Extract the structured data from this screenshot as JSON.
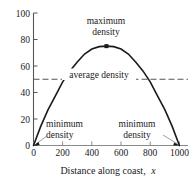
{
  "chart_data": {
    "type": "line",
    "title": "",
    "xlabel": "Distance along coast, x",
    "ylabel": "",
    "xlim": [
      0,
      1000
    ],
    "ylim": [
      0,
      100
    ],
    "grid": false,
    "legend": "none",
    "x_ticks": [
      "0",
      "200",
      "400",
      "600",
      "800",
      "1000"
    ],
    "x_tick_values": [
      0,
      200,
      400,
      600,
      800,
      1000
    ],
    "y_ticks": [
      "0",
      "20",
      "40",
      "60",
      "80",
      "100"
    ],
    "y_tick_values": [
      0,
      20,
      40,
      60,
      80,
      100
    ],
    "series": [
      {
        "name": "density",
        "style": "solid-curve",
        "color": "#1a1a1a",
        "x": [
          0,
          50,
          100,
          150,
          200,
          250,
          300,
          350,
          400,
          450,
          500,
          550,
          600,
          650,
          700,
          750,
          800,
          850,
          900,
          950,
          1000
        ],
        "values": [
          0,
          14.6,
          27.0,
          37.5,
          48.0,
          56.3,
          63.0,
          69.0,
          72.8,
          74.6,
          75.0,
          74.6,
          72.8,
          69.0,
          63.0,
          56.3,
          48.0,
          37.5,
          27.0,
          14.6,
          0
        ]
      },
      {
        "name": "average density",
        "style": "dashed-horizontal",
        "color": "#555555",
        "value": 50
      }
    ],
    "markers": [
      {
        "name": "maximum",
        "x": 500,
        "y": 75
      }
    ],
    "annotations": [
      {
        "name": "maximum-density",
        "line1": "maximum",
        "line2": "density",
        "target_x": 500,
        "target_y": 75
      },
      {
        "name": "average-density",
        "line1": "average density",
        "line2": "",
        "target_x": 400,
        "target_y": 50
      },
      {
        "name": "minimum-density-left",
        "line1": "minimum",
        "line2": "density",
        "target_x": 0,
        "target_y": 0
      },
      {
        "name": "minimum-density-right",
        "line1": "minimum",
        "line2": "density",
        "target_x": 1000,
        "target_y": 0
      }
    ],
    "colors": {
      "curve": "#1a1a1a",
      "axis": "#555555",
      "dashed": "#666666",
      "leader": "#9a9a9a",
      "text": "#1a1a1a",
      "background": "#ffffff"
    }
  },
  "axis_title": {
    "prefix": "Distance along coast,",
    "variable": "x"
  },
  "labels": {
    "maximum_line1": "maximum",
    "maximum_line2": "density",
    "average": "average density",
    "minimum_left_line1": "minimum",
    "minimum_left_line2": "density",
    "minimum_right_line1": "minimum",
    "minimum_right_line2": "density"
  },
  "ticks": {
    "y": {
      "t100": "100",
      "t80": "80",
      "t60": "60",
      "t40": "40",
      "t20": "20",
      "t0": "0"
    },
    "x": {
      "t0": "0",
      "t200": "200",
      "t400": "400",
      "t600": "600",
      "t800": "800",
      "t1000": "1000"
    }
  }
}
